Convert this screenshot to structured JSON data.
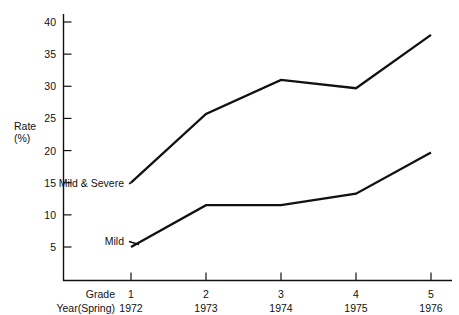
{
  "chart_data": {
    "type": "line",
    "title": "",
    "xlabel": "",
    "ylabel": "Rate\n(%)",
    "ylabel_line1": "Rate",
    "ylabel_line2": "(%)",
    "ylim": [
      0,
      42
    ],
    "yticks": [
      5,
      10,
      15,
      20,
      25,
      30,
      35,
      40
    ],
    "ytick_labels": [
      "5",
      "10",
      "15",
      "20",
      "25",
      "30",
      "35",
      "40"
    ],
    "grid": false,
    "legend": "inline-annotations",
    "categories": [
      "1",
      "2",
      "3",
      "4",
      "5"
    ],
    "x_axis_rows": [
      {
        "row_title": "Grade",
        "values": [
          "1",
          "2",
          "3",
          "4",
          "5"
        ]
      },
      {
        "row_title": "Year(Spring)",
        "values": [
          "1972",
          "1973",
          "1974",
          "1975",
          "1976"
        ]
      }
    ],
    "series": [
      {
        "name": "Mild & Severe",
        "values": [
          15.0,
          25.7,
          31.0,
          29.7,
          38.0
        ],
        "color": "#111111"
      },
      {
        "name": "Mild",
        "values": [
          5.0,
          11.5,
          11.5,
          13.3,
          19.7
        ],
        "color": "#111111"
      }
    ],
    "annotations": [
      {
        "text": "Mild & Severe",
        "series": "Mild & Severe",
        "anchor_value": 15.0
      },
      {
        "text": "Mild",
        "series": "Mild",
        "anchor_value": 6.0
      }
    ]
  },
  "colors": {
    "line": "#111111",
    "axis": "#111111",
    "background": "#ffffff"
  }
}
